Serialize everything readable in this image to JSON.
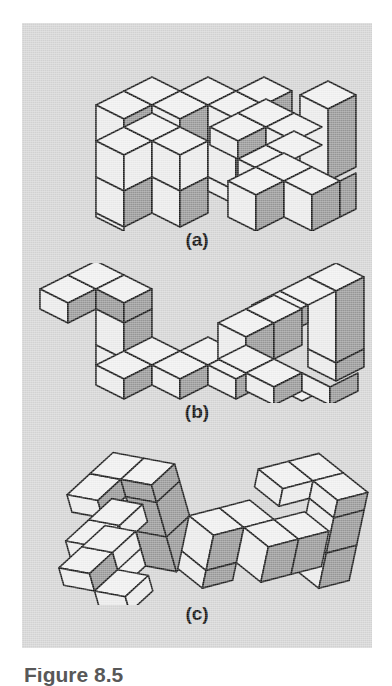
{
  "figure": {
    "caption": "Figure 8.5",
    "background_color": "#d7d7d7",
    "page_color": "#ffffff",
    "panels": [
      {
        "label": "(a)",
        "left_object_name": "cube-structure-a-left",
        "right_object_name": "cube-structure-a-right",
        "relation": "pair"
      },
      {
        "label": "(b)",
        "left_object_name": "cube-structure-b-left",
        "right_object_name": "cube-structure-b-right",
        "relation": "pair"
      },
      {
        "label": "(c)",
        "left_object_name": "cube-structure-c-left",
        "right_object_name": "cube-structure-c-right",
        "relation": "pair"
      }
    ],
    "cube_colors": {
      "top_face": "#f2f2f2",
      "left_face": "#ededed",
      "right_face": "#9a9a9a",
      "edge": "#1a1a1a"
    }
  }
}
